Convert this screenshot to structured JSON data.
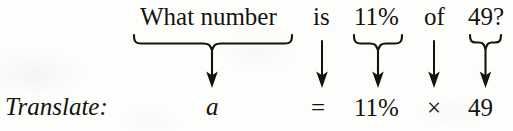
{
  "figure": {
    "kind": "translate-percent-sentence-diagram",
    "ink_color": "#15130f",
    "background_color": "#fdfdfc"
  },
  "label": {
    "text": "Translate:"
  },
  "sentence": {
    "tokens": [
      {
        "id": "phrase",
        "text": "What number",
        "connector": "brace",
        "x": 140,
        "width": 146
      },
      {
        "id": "is",
        "text": "is",
        "connector": "arrow",
        "x": 313,
        "width": 20
      },
      {
        "id": "percent",
        "text": "11%",
        "connector": "brace",
        "x": 354,
        "width": 47
      },
      {
        "id": "of",
        "text": "of",
        "connector": "arrow",
        "x": 424,
        "width": 25
      },
      {
        "id": "base",
        "text": "49?",
        "connector": "brace",
        "x": 468,
        "width": 38
      }
    ]
  },
  "equation": {
    "tokens": [
      {
        "id": "variable",
        "text": "a",
        "style": "italic",
        "x": 206
      },
      {
        "id": "equals",
        "text": "=",
        "style": "roman",
        "x": 311
      },
      {
        "id": "percent",
        "text": "11%",
        "style": "roman",
        "x": 354
      },
      {
        "id": "times",
        "text": "×",
        "style": "roman",
        "x": 427
      },
      {
        "id": "base",
        "text": "49",
        "style": "roman",
        "x": 468
      }
    ]
  },
  "connectors": {
    "brace_phrase": {
      "left": 133,
      "right": 292,
      "center": 212,
      "top": 34,
      "arrow_tip": 87
    },
    "arrow_is": {
      "center": 322,
      "top": 40,
      "arrow_tip": 87
    },
    "brace_percent": {
      "left": 353,
      "right": 403,
      "center": 378,
      "top": 34,
      "arrow_tip": 87
    },
    "arrow_of": {
      "center": 434,
      "top": 40,
      "arrow_tip": 87
    },
    "brace_base": {
      "left": 469,
      "right": 501,
      "center": 485,
      "top": 34,
      "arrow_tip": 87
    }
  }
}
